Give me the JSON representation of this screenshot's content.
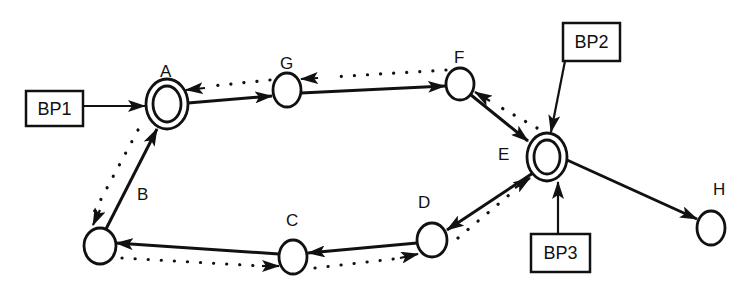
{
  "diagram": {
    "nodes": [
      {
        "id": "A",
        "label": "A",
        "cx": 167,
        "cy": 104,
        "rx": 21,
        "ry": 25,
        "double": true,
        "lx": 160,
        "ly": 77
      },
      {
        "id": "G",
        "label": "G",
        "cx": 287,
        "cy": 90,
        "rx": 14,
        "ry": 17,
        "double": false,
        "lx": 280,
        "ly": 69
      },
      {
        "id": "F",
        "label": "F",
        "cx": 460,
        "cy": 84,
        "rx": 14,
        "ry": 16,
        "double": false,
        "lx": 454,
        "ly": 63
      },
      {
        "id": "E",
        "label": "E",
        "cx": 547,
        "cy": 157,
        "rx": 20,
        "ry": 24,
        "double": true,
        "lx": 498,
        "ly": 160
      },
      {
        "id": "D",
        "label": "D",
        "cx": 432,
        "cy": 240,
        "rx": 15,
        "ry": 17,
        "double": false,
        "lx": 418,
        "ly": 208
      },
      {
        "id": "C",
        "label": "C",
        "cx": 293,
        "cy": 257,
        "rx": 14,
        "ry": 17,
        "double": false,
        "lx": 286,
        "ly": 226
      },
      {
        "id": "N",
        "label": "",
        "cx": 100,
        "cy": 246,
        "rx": 16,
        "ry": 18,
        "double": false,
        "lx": 0,
        "ly": 0
      },
      {
        "id": "H",
        "label": "H",
        "cx": 711,
        "cy": 228,
        "rx": 14,
        "ry": 17,
        "double": false,
        "lx": 713,
        "ly": 195
      }
    ],
    "edge_label_B": {
      "label": "B",
      "x": 137,
      "y": 200
    },
    "boxes": [
      {
        "id": "BP1",
        "label": "BP1",
        "x": 26,
        "y": 91,
        "w": 57,
        "h": 35
      },
      {
        "id": "BP2",
        "label": "BP2",
        "x": 563,
        "y": 23,
        "w": 57,
        "h": 38
      },
      {
        "id": "BP3",
        "label": "BP3",
        "x": 531,
        "y": 234,
        "w": 59,
        "h": 38
      }
    ]
  }
}
